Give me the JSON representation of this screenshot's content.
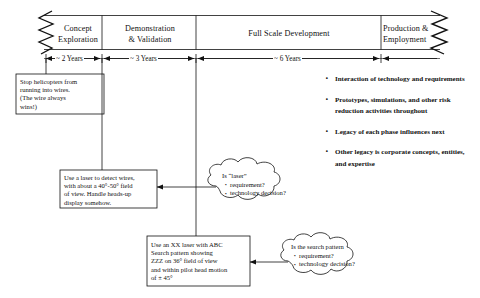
{
  "diagram": {
    "phases": [
      {
        "label": "Concept\nExploration",
        "duration": "~ 2 Years"
      },
      {
        "label": "Demonstration\n& Validation",
        "duration": "~ 3 Years"
      },
      {
        "label": "Full Scale Development",
        "duration": "~ 6 Years"
      },
      {
        "label": "Production &\nEmployment",
        "duration": ""
      }
    ],
    "notes": [
      {
        "id": "need-note",
        "text": "Stop helicopters from\nrunning into wires.\n(The wire always\nwins!)"
      },
      {
        "id": "laser-requirement-note",
        "text": "Use a laser to detect wires,\nwith about a 40°-50° field\nof view.  Handle heads-up\ndisplay somehow."
      },
      {
        "id": "xx-laser-spec-note",
        "text": "Use an XX laser with ABC\nSearch pattern showing\nZZZ on 36° field of view\nand within pilot head motion\nof  ± 45°"
      }
    ],
    "clouds": [
      {
        "id": "laser-question-cloud",
        "heading": "Is “laser”",
        "items": [
          "requirement?",
          "technology decision?"
        ]
      },
      {
        "id": "search-pattern-question-cloud",
        "heading": "Is the search pattern",
        "items": [
          "requirement?",
          "technology decision?"
        ]
      }
    ],
    "bullets": [
      "Interaction of technology and requirements",
      "Prototypes, simulations, and other risk reduction activities throughout",
      "Legacy of each phase influences next",
      "Other legacy is corporate concepts, entities, and expertise"
    ],
    "colors": {
      "ink": "#111111",
      "background": "#ffffff"
    }
  }
}
